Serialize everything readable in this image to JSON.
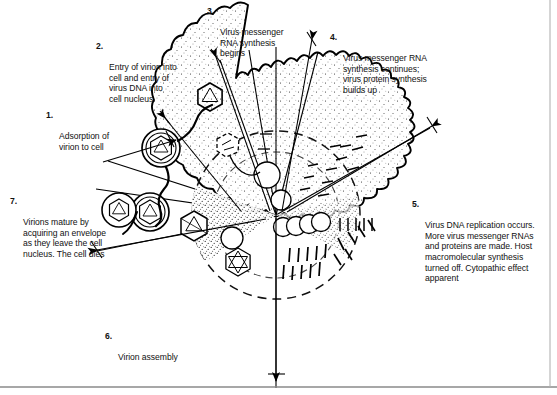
{
  "figure": {
    "background_color": "#ffffff",
    "ink_color": "#000000",
    "border": {
      "bottom_rule": true,
      "right_rule": true,
      "color": "#888888"
    }
  },
  "captions": [
    {
      "id": "step-1",
      "number": "1.",
      "text": "Adsorption of\nvirion to cell"
    },
    {
      "id": "step-2",
      "number": "2.",
      "text": "Entry of virion into\ncell and entry of\nvirus DNA into\ncell nucleus"
    },
    {
      "id": "step-3",
      "number": "3.",
      "text": "Virus messenger\nRNA synthesis\nbegins"
    },
    {
      "id": "step-4",
      "number": "4.",
      "text": "Virus messenger RNA\nsynthesis continues;\nvirus protein synthesis\nbuilds up"
    },
    {
      "id": "step-5",
      "number": "5.",
      "text": "Virus DNA replication occurs.\nMore virus messenger RNAs\nand proteins are made. Host\nmacromolecular synthesis\nturned off.  Cytopathic effect\napparent"
    },
    {
      "id": "step-6",
      "number": "6.",
      "text": "Virion assembly"
    },
    {
      "id": "step-7",
      "number": "7.",
      "text": "Virions mature by\nacquiring an envelope\nas they leave the cell\nnucleus. The cell dies"
    }
  ],
  "diagram_parts": {
    "cell_membrane": "scalloped-cell-outline",
    "nucleus": "dashed-nuclear-envelope",
    "cytoplasm_stipple": "stippled-cytoplasm",
    "virions_outside": 2,
    "virions_entering": 1,
    "virions_assembling": 3,
    "nucleocapsid_icon": "hexagonal-capsid",
    "enveloped_virion_icon": "enveloped-virion",
    "budding_chain": "budding-vesicle-chain",
    "leader_lines": 7,
    "radial_hub": {
      "x": 276,
      "y": 215
    }
  }
}
